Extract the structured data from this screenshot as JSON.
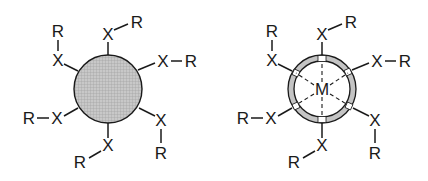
{
  "figures": [
    {
      "id": "left",
      "description": "Solid nanoparticle core with surface-bound X–R ligands",
      "core": {
        "fill": "#bdbdbd",
        "style": "solid-shaded"
      },
      "ligands": [
        {
          "x_label": "X",
          "r_label": "R",
          "position": "top"
        },
        {
          "x_label": "X",
          "r_label": "R",
          "position": "upper-right"
        },
        {
          "x_label": "X",
          "r_label": "R",
          "position": "lower-right"
        },
        {
          "x_label": "X",
          "r_label": "R",
          "position": "bottom"
        },
        {
          "x_label": "X",
          "r_label": "R",
          "position": "lower-left"
        },
        {
          "x_label": "X",
          "r_label": "R",
          "position": "upper-left"
        }
      ]
    },
    {
      "id": "right",
      "description": "Ring-shaped shell with central metal M and dashed M–X interactions",
      "core": {
        "fill": "#c4c4c4",
        "style": "segmented-ring",
        "center_label": "M"
      },
      "ligands": [
        {
          "x_label": "X",
          "r_label": "R",
          "position": "top"
        },
        {
          "x_label": "X",
          "r_label": "R",
          "position": "upper-right"
        },
        {
          "x_label": "X",
          "r_label": "R",
          "position": "lower-right"
        },
        {
          "x_label": "X",
          "r_label": "R",
          "position": "bottom"
        },
        {
          "x_label": "X",
          "r_label": "R",
          "position": "lower-left"
        },
        {
          "x_label": "X",
          "r_label": "R",
          "position": "upper-left"
        }
      ]
    }
  ],
  "labels": {
    "x": "X",
    "r": "R",
    "m": "M"
  },
  "colors": {
    "ink": "#1a1a1a",
    "core_fill": "#bdbdbd",
    "ring_fill": "#c4c4c4",
    "background": "#ffffff"
  }
}
